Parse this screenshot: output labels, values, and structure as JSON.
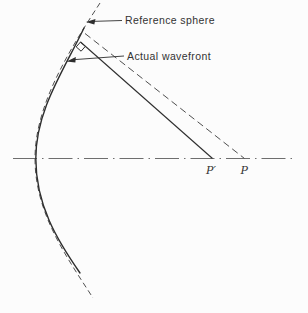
{
  "figure": {
    "annotations": {
      "reference_sphere": "Reference sphere",
      "actual_wavefront": "Actual wavefront"
    },
    "points": {
      "p_prime": "P′",
      "p": "P"
    },
    "colors": {
      "curve": "#2e2e2e",
      "dashed_curve": "#4f4f4f",
      "axis": "#6e6e6e",
      "text": "#333333",
      "background": "#fcfcfc"
    }
  }
}
